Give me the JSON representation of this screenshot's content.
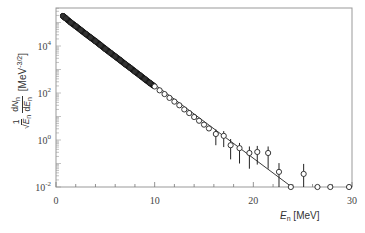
{
  "chart_data": {
    "type": "scatter",
    "title": "",
    "xlabel": "E_n [MeV]",
    "ylabel": "1/√E_n · dN_n/dE_n [MeV^-3/2]",
    "xlabel_parts": {
      "var": "E",
      "sub": "n",
      "unit": "[MeV]"
    },
    "ylabel_parts": {
      "prefix_num": "1",
      "prefix_den": "√E",
      "prefix_den_sub": "n",
      "frac_num": "dN",
      "frac_num_sub": "n",
      "frac_den": "dE",
      "frac_den_sub": "n",
      "unit": "[MeV",
      "unit_exp": "-3/2",
      "unit_close": "]"
    },
    "xlim": [
      0,
      30
    ],
    "ylim": [
      0.01,
      400000
    ],
    "yscale": "log",
    "x_ticks": [
      0,
      10,
      20,
      30
    ],
    "x_tick_labels": [
      "0",
      "10",
      "20",
      "30"
    ],
    "y_ticks": [
      0.01,
      1,
      100,
      10000
    ],
    "y_tick_labels": [
      "10^-2",
      "10^0",
      "10^2",
      "10^4"
    ],
    "grid": false,
    "legend": null,
    "series": [
      {
        "name": "data",
        "marker": "open-circle",
        "x": [
          0.7,
          1.0,
          1.5,
          2.0,
          2.5,
          3.0,
          3.5,
          4.0,
          4.5,
          5.0,
          5.5,
          6.0,
          6.5,
          7.0,
          7.5,
          8.0,
          8.5,
          9.0,
          9.5,
          10.0,
          10.5,
          11.0,
          11.5,
          12.0,
          12.5,
          13.0,
          13.5,
          14.0,
          14.5,
          15.0,
          15.5,
          16.2,
          17.0,
          17.7,
          18.6,
          19.6,
          20.4,
          21.5,
          22.6,
          23.8,
          25.1,
          26.5,
          27.8,
          29.7
        ],
        "y": [
          190000,
          150000,
          100000,
          70000,
          48000,
          33000,
          23000,
          16000,
          11000,
          7500,
          5200,
          3600,
          2500,
          1700,
          1200,
          820,
          570,
          390,
          270,
          190,
          130,
          90,
          62,
          43,
          30,
          20,
          14,
          9.5,
          6.6,
          4.5,
          3.1,
          1.8,
          1.5,
          0.6,
          0.45,
          0.28,
          0.31,
          0.28,
          0.044,
          0.01,
          0.036,
          0.01,
          0.01,
          0.01
        ],
        "yerr_up": [
          0,
          0,
          0,
          0,
          0,
          0,
          0,
          0,
          0,
          0,
          0,
          0,
          0,
          0,
          0,
          0,
          0,
          0,
          0,
          0,
          0,
          0,
          0,
          0,
          0,
          0,
          0,
          0,
          0,
          0,
          0,
          1.0,
          0.9,
          0.5,
          0.3,
          0.25,
          0.25,
          0.25,
          0.06,
          0,
          0.06,
          0,
          0,
          0
        ],
        "yerr_down": [
          0,
          0,
          0,
          0,
          0,
          0,
          0,
          0,
          0,
          0,
          0,
          0,
          0,
          0,
          0,
          0,
          0,
          0,
          0,
          0,
          0,
          0,
          0,
          0,
          0,
          0,
          0,
          0,
          0,
          0,
          0,
          1.2,
          1.0,
          0.45,
          0.35,
          0.22,
          0.22,
          0.22,
          0.034,
          0,
          0.026,
          0,
          0,
          0
        ]
      },
      {
        "name": "fit",
        "type": "line",
        "x": [
          0.7,
          23.9
        ],
        "y": [
          190000,
          0.01
        ]
      }
    ]
  }
}
